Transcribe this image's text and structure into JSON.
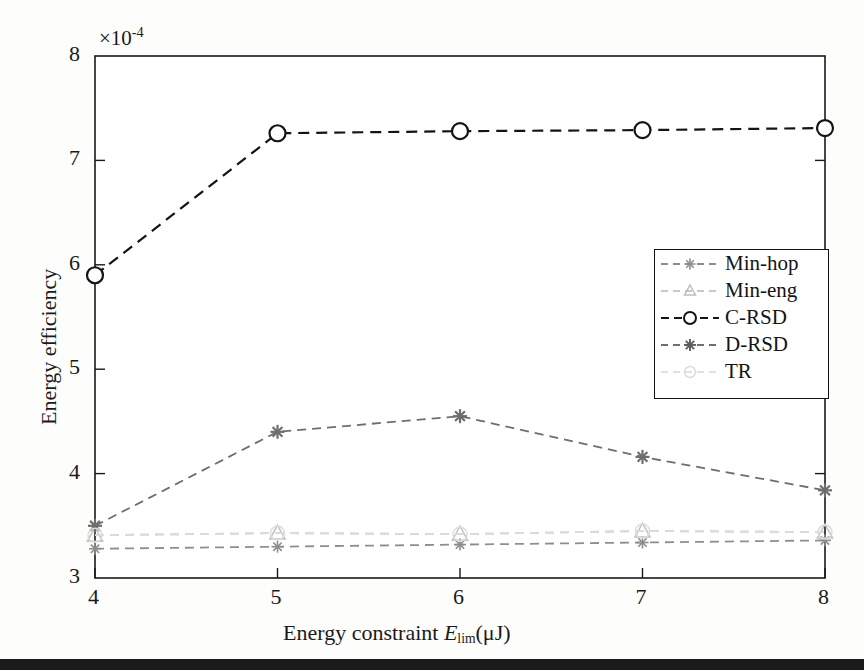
{
  "figure": {
    "axis_exponent": "×10⁻⁴",
    "exponent_base": "×10",
    "exponent_power": "-4",
    "scale_factor": 0.0001
  },
  "chart_data": {
    "type": "line",
    "title": "",
    "xlabel": "Energy constraint E_lim(μJ)",
    "xlabel_parts": {
      "prefix": "Energy constraint ",
      "symbol": "E",
      "subscript": "lim",
      "unit": "(μJ)"
    },
    "ylabel": "Energy efficiency",
    "y_exponent_label": "×10⁻⁴",
    "x": [
      4,
      5,
      6,
      7,
      8
    ],
    "xticks": [
      "4",
      "5",
      "6",
      "7",
      "8"
    ],
    "yticks": [
      "3",
      "4",
      "5",
      "6",
      "7",
      "8"
    ],
    "xlim": [
      4,
      8
    ],
    "ylim": [
      3,
      8
    ],
    "grid": false,
    "legend_position": "center-right",
    "series": [
      {
        "name": "Min-hop",
        "marker": "star",
        "color": "#8e8e8e",
        "linestyle": "dashed",
        "values": [
          3.28,
          3.3,
          3.32,
          3.34,
          3.36
        ]
      },
      {
        "name": "Min-eng",
        "marker": "triangle",
        "color": "#c3c3c3",
        "linestyle": "dashed",
        "values": [
          3.41,
          3.43,
          3.42,
          3.45,
          3.44
        ]
      },
      {
        "name": "C-RSD",
        "marker": "circle",
        "color": "#141414",
        "linestyle": "dashed",
        "values": [
          5.9,
          7.26,
          7.28,
          7.29,
          7.31
        ]
      },
      {
        "name": "D-RSD",
        "marker": "star",
        "color": "#6e6e6e",
        "linestyle": "dashed",
        "values": [
          3.5,
          4.4,
          4.55,
          4.16,
          3.84
        ]
      },
      {
        "name": "TR",
        "marker": "circle-open",
        "color": "#dcdcdc",
        "linestyle": "dashed",
        "values": [
          3.41,
          3.43,
          3.42,
          3.45,
          3.44
        ]
      }
    ]
  },
  "legend": {
    "items": [
      {
        "label": "Min-hop"
      },
      {
        "label": "Min-eng"
      },
      {
        "label": "C-RSD"
      },
      {
        "label": "D-RSD"
      },
      {
        "label": "TR"
      }
    ]
  }
}
